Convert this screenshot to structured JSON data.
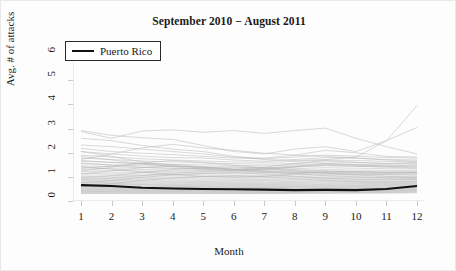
{
  "chart_data": {
    "type": "line",
    "title": "September 2010 − August 2011",
    "xlabel": "Month",
    "ylabel": "Avg. # of attacks",
    "xlim": [
      1,
      12
    ],
    "ylim": [
      0,
      6.3
    ],
    "xticks": [
      "1",
      "2",
      "3",
      "4",
      "5",
      "6",
      "7",
      "8",
      "9",
      "10",
      "11",
      "12"
    ],
    "yticks": [
      "0",
      "1",
      "2",
      "3",
      "4",
      "5",
      "6"
    ],
    "grid": false,
    "legend_position": "top-left",
    "x": [
      1,
      2,
      3,
      4,
      5,
      6,
      7,
      8,
      9,
      10,
      11,
      12
    ],
    "highlight_color": "#111111",
    "background_color": "#fdfdfd",
    "series_color": "#b4b4b4",
    "legend": [
      {
        "name": "Puerto Rico",
        "color": "#111111"
      }
    ],
    "series": [
      {
        "name": "Puerto Rico",
        "highlight": true,
        "values": [
          0.66,
          0.62,
          0.55,
          0.52,
          0.5,
          0.49,
          0.47,
          0.45,
          0.46,
          0.45,
          0.5,
          0.62
        ]
      },
      {
        "name": "region-01",
        "values": [
          2.92,
          2.72,
          2.62,
          2.55,
          2.3,
          2.05,
          1.95,
          2.15,
          2.25,
          2.05,
          2.5,
          3.05
        ]
      },
      {
        "name": "region-02",
        "values": [
          2.88,
          2.6,
          2.9,
          2.95,
          2.85,
          2.92,
          2.8,
          2.92,
          3.02,
          2.6,
          2.25,
          1.95
        ]
      },
      {
        "name": "region-03",
        "values": [
          2.6,
          2.5,
          2.3,
          2.15,
          2.05,
          1.85,
          1.72,
          1.68,
          1.72,
          1.82,
          2.5,
          3.95
        ]
      },
      {
        "name": "region-04",
        "values": [
          2.32,
          2.25,
          2.15,
          2.05,
          1.95,
          1.82,
          1.78,
          1.9,
          2.1,
          2.0,
          1.85,
          1.82
        ]
      },
      {
        "name": "region-05",
        "values": [
          2.18,
          2.05,
          1.98,
          1.92,
          1.85,
          1.78,
          1.75,
          1.82,
          1.9,
          1.86,
          1.8,
          1.78
        ]
      },
      {
        "name": "region-06",
        "values": [
          2.05,
          1.95,
          1.86,
          1.8,
          1.78,
          1.7,
          1.65,
          1.72,
          1.8,
          1.78,
          1.72,
          1.7
        ]
      },
      {
        "name": "region-07",
        "values": [
          1.72,
          1.95,
          2.2,
          2.35,
          2.2,
          2.1,
          1.98,
          1.9,
          1.85,
          1.78,
          1.7,
          1.65
        ]
      },
      {
        "name": "region-08",
        "values": [
          1.9,
          1.82,
          1.75,
          1.7,
          1.66,
          1.62,
          1.6,
          1.64,
          1.7,
          1.68,
          1.64,
          1.62
        ]
      },
      {
        "name": "region-09",
        "values": [
          1.78,
          1.72,
          1.66,
          1.62,
          1.58,
          1.55,
          1.52,
          1.56,
          1.62,
          1.6,
          1.56,
          1.55
        ]
      },
      {
        "name": "region-10",
        "values": [
          1.65,
          1.6,
          1.56,
          1.52,
          1.5,
          1.48,
          1.45,
          1.5,
          1.55,
          1.52,
          1.5,
          1.48
        ]
      },
      {
        "name": "region-11",
        "values": [
          1.55,
          1.5,
          1.46,
          1.44,
          1.42,
          1.4,
          1.38,
          1.42,
          1.46,
          1.44,
          1.42,
          1.4
        ]
      },
      {
        "name": "region-12",
        "values": [
          1.46,
          1.42,
          1.38,
          1.36,
          1.34,
          1.32,
          1.3,
          1.34,
          1.38,
          1.36,
          1.34,
          1.33
        ]
      },
      {
        "name": "region-13",
        "values": [
          1.38,
          1.34,
          1.3,
          1.28,
          1.26,
          1.25,
          1.24,
          1.27,
          1.3,
          1.28,
          1.27,
          1.26
        ]
      },
      {
        "name": "region-14",
        "values": [
          1.3,
          1.27,
          1.24,
          1.22,
          1.2,
          1.19,
          1.18,
          1.2,
          1.23,
          1.22,
          1.2,
          1.2
        ]
      },
      {
        "name": "region-15",
        "values": [
          1.22,
          1.2,
          1.18,
          1.16,
          1.14,
          1.13,
          1.12,
          1.14,
          1.17,
          1.16,
          1.15,
          1.14
        ]
      },
      {
        "name": "region-16",
        "values": [
          1.15,
          1.13,
          1.11,
          1.1,
          1.08,
          1.07,
          1.06,
          1.08,
          1.1,
          1.1,
          1.09,
          1.08
        ]
      },
      {
        "name": "region-17",
        "values": [
          1.08,
          1.07,
          1.05,
          1.04,
          1.02,
          1.01,
          1.0,
          1.02,
          1.04,
          1.04,
          1.03,
          1.02
        ]
      },
      {
        "name": "region-18",
        "values": [
          1.02,
          1.0,
          0.99,
          0.98,
          0.96,
          0.95,
          0.95,
          0.96,
          0.98,
          0.98,
          0.97,
          0.97
        ]
      },
      {
        "name": "region-19",
        "values": [
          0.96,
          0.95,
          0.94,
          0.92,
          0.91,
          0.9,
          0.89,
          0.91,
          0.93,
          0.92,
          0.92,
          0.92
        ]
      },
      {
        "name": "region-20",
        "values": [
          0.91,
          0.9,
          0.88,
          0.87,
          0.86,
          0.85,
          0.85,
          0.86,
          0.88,
          0.87,
          0.87,
          0.88
        ]
      },
      {
        "name": "region-21",
        "values": [
          0.86,
          0.85,
          0.84,
          0.82,
          0.81,
          0.8,
          0.8,
          0.81,
          0.83,
          0.83,
          0.82,
          0.84
        ]
      },
      {
        "name": "region-22",
        "values": [
          0.82,
          0.8,
          0.79,
          0.78,
          0.77,
          0.76,
          0.76,
          0.77,
          0.79,
          0.78,
          0.78,
          0.8
        ]
      },
      {
        "name": "region-23",
        "values": [
          0.78,
          0.76,
          0.75,
          0.74,
          0.73,
          0.72,
          0.72,
          0.73,
          0.75,
          0.74,
          0.74,
          0.76
        ]
      },
      {
        "name": "region-24",
        "values": [
          0.74,
          0.73,
          0.71,
          0.7,
          0.69,
          0.69,
          0.68,
          0.69,
          0.71,
          0.71,
          0.71,
          0.73
        ]
      },
      {
        "name": "region-25",
        "values": [
          0.7,
          0.69,
          0.68,
          0.67,
          0.66,
          0.65,
          0.65,
          0.66,
          0.68,
          0.67,
          0.68,
          0.7
        ]
      },
      {
        "name": "region-26",
        "values": [
          0.67,
          0.66,
          0.65,
          0.64,
          0.63,
          0.62,
          0.62,
          0.63,
          0.64,
          0.64,
          0.65,
          0.67
        ]
      },
      {
        "name": "region-27",
        "values": [
          0.63,
          0.62,
          0.61,
          0.6,
          0.6,
          0.59,
          0.59,
          0.6,
          0.61,
          0.61,
          0.62,
          0.64
        ]
      },
      {
        "name": "region-28",
        "values": [
          0.6,
          0.59,
          0.58,
          0.57,
          0.57,
          0.56,
          0.56,
          0.57,
          0.58,
          0.58,
          0.59,
          0.61
        ]
      },
      {
        "name": "region-29",
        "values": [
          0.57,
          0.56,
          0.55,
          0.55,
          0.54,
          0.53,
          0.53,
          0.54,
          0.55,
          0.55,
          0.56,
          0.58
        ]
      },
      {
        "name": "region-30",
        "values": [
          0.54,
          0.53,
          0.52,
          0.52,
          0.51,
          0.51,
          0.5,
          0.51,
          0.52,
          0.52,
          0.53,
          0.55
        ]
      },
      {
        "name": "region-31",
        "values": [
          0.51,
          0.5,
          0.5,
          0.49,
          0.48,
          0.48,
          0.48,
          0.48,
          0.5,
          0.5,
          0.5,
          0.52
        ]
      },
      {
        "name": "region-32",
        "values": [
          0.48,
          0.47,
          0.47,
          0.46,
          0.46,
          0.45,
          0.45,
          0.46,
          0.47,
          0.47,
          0.48,
          0.49
        ]
      },
      {
        "name": "region-33",
        "values": [
          0.45,
          0.45,
          0.44,
          0.44,
          0.43,
          0.43,
          0.43,
          0.43,
          0.44,
          0.44,
          0.45,
          0.47
        ]
      },
      {
        "name": "region-34",
        "values": [
          0.42,
          0.42,
          0.42,
          0.41,
          0.41,
          0.4,
          0.4,
          0.41,
          0.42,
          0.42,
          0.43,
          0.44
        ]
      },
      {
        "name": "region-35",
        "values": [
          0.4,
          0.39,
          0.39,
          0.39,
          0.38,
          0.38,
          0.38,
          0.38,
          0.39,
          0.4,
          0.4,
          0.42
        ]
      },
      {
        "name": "region-36",
        "values": [
          0.37,
          0.37,
          0.36,
          0.36,
          0.36,
          0.36,
          0.35,
          0.36,
          0.37,
          0.37,
          0.38,
          0.39
        ]
      },
      {
        "name": "region-37",
        "values": [
          0.34,
          0.34,
          0.34,
          0.34,
          0.33,
          0.33,
          0.33,
          0.34,
          0.34,
          0.35,
          0.35,
          0.37
        ]
      },
      {
        "name": "region-38",
        "values": [
          0.31,
          0.31,
          0.31,
          0.31,
          0.31,
          0.31,
          0.31,
          0.31,
          0.32,
          0.32,
          0.33,
          0.34
        ]
      },
      {
        "name": "region-39",
        "values": [
          1.68,
          1.6,
          1.52,
          1.45,
          1.38,
          1.32,
          1.35,
          1.45,
          1.55,
          1.5,
          1.45,
          1.42
        ]
      },
      {
        "name": "region-40",
        "values": [
          1.58,
          1.48,
          1.4,
          1.35,
          1.3,
          1.28,
          1.32,
          1.4,
          1.48,
          1.44,
          1.4,
          1.36
        ]
      },
      {
        "name": "region-41",
        "values": [
          1.12,
          1.25,
          1.38,
          1.45,
          1.4,
          1.3,
          1.22,
          1.18,
          1.15,
          1.12,
          1.1,
          1.08
        ]
      },
      {
        "name": "region-42",
        "values": [
          0.95,
          1.05,
          1.18,
          1.3,
          1.38,
          1.42,
          1.35,
          1.25,
          1.15,
          1.08,
          1.02,
          0.98
        ]
      },
      {
        "name": "region-43",
        "values": [
          1.42,
          1.32,
          1.2,
          1.1,
          1.02,
          0.98,
          1.02,
          1.12,
          1.22,
          1.2,
          1.18,
          1.2
        ]
      },
      {
        "name": "region-44",
        "values": [
          0.88,
          0.95,
          1.05,
          1.15,
          1.22,
          1.25,
          1.2,
          1.12,
          1.05,
          1.0,
          0.96,
          0.95
        ]
      },
      {
        "name": "region-45",
        "values": [
          2.05,
          1.85,
          1.62,
          1.48,
          1.35,
          1.3,
          1.4,
          1.55,
          1.68,
          1.6,
          1.55,
          1.6
        ]
      },
      {
        "name": "region-46",
        "values": [
          1.25,
          1.4,
          1.58,
          1.68,
          1.6,
          1.48,
          1.38,
          1.3,
          1.25,
          1.22,
          1.2,
          1.18
        ]
      },
      {
        "name": "region-47",
        "values": [
          0.75,
          0.85,
          0.98,
          1.08,
          1.15,
          1.18,
          1.12,
          1.02,
          0.95,
          0.9,
          0.88,
          0.9
        ]
      },
      {
        "name": "region-48",
        "values": [
          1.85,
          1.7,
          1.55,
          1.42,
          1.32,
          1.25,
          1.3,
          1.42,
          1.52,
          1.48,
          1.45,
          1.5
        ]
      },
      {
        "name": "region-49",
        "values": [
          0.62,
          0.72,
          0.85,
          0.95,
          1.02,
          1.05,
          1.0,
          0.92,
          0.85,
          0.8,
          0.78,
          0.8
        ]
      },
      {
        "name": "region-50",
        "values": [
          1.35,
          1.45,
          1.55,
          1.52,
          1.42,
          1.32,
          1.25,
          1.2,
          1.18,
          1.16,
          1.15,
          1.18
        ]
      }
    ]
  }
}
